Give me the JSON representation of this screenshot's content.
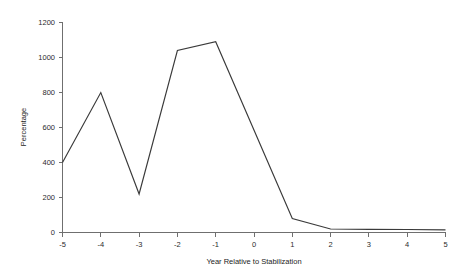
{
  "chart_data": {
    "type": "line",
    "title": "",
    "xlabel": "Year Relative to Stabilization",
    "ylabel": "Percentage",
    "x": [
      -5,
      -4,
      -3,
      -2,
      -1,
      1,
      2,
      3,
      4,
      5
    ],
    "values": [
      400,
      800,
      220,
      1040,
      1090,
      80,
      20,
      18,
      17,
      15
    ],
    "series": [
      {
        "name": "Percentage",
        "x": [
          -5,
          -4,
          -3,
          -2,
          -1,
          1,
          2,
          3,
          4,
          5
        ],
        "values": [
          400,
          800,
          220,
          1040,
          1090,
          80,
          20,
          18,
          17,
          15
        ]
      }
    ],
    "xlim": [
      -5,
      5
    ],
    "ylim": [
      0,
      1200
    ],
    "xticks": [
      -5,
      -4,
      -3,
      -2,
      -1,
      0,
      1,
      2,
      3,
      4,
      5
    ],
    "xtick_labels": [
      "-5",
      "-4",
      "-3",
      "-2",
      "-1",
      "0",
      "1",
      "2",
      "3",
      "4",
      "5"
    ],
    "yticks": [
      0,
      200,
      400,
      600,
      800,
      1000,
      1200
    ],
    "ytick_labels": [
      "0",
      "200",
      "400",
      "600",
      "800",
      "1000",
      "1200"
    ],
    "grid": false,
    "legend": false,
    "legend_position": "none",
    "line_color": "#3a3a3a",
    "axis_color": "#6f6f6f",
    "background_color": "#ffffff"
  }
}
